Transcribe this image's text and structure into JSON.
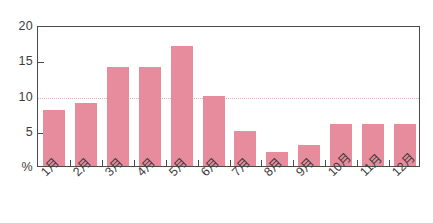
{
  "chart_data": {
    "type": "bar",
    "title": "",
    "subtitle": "",
    "xlabel": "",
    "ylabel": "%",
    "categories": [
      "1月",
      "2月",
      "3月",
      "4月",
      "5月",
      "6月",
      "7月",
      "8月",
      "9月",
      "10月",
      "11月",
      "12月"
    ],
    "values": [
      8,
      9,
      14,
      14,
      17,
      10,
      5,
      2,
      3,
      6,
      6,
      6
    ],
    "ylim": [
      0,
      20
    ],
    "yticks": [
      0,
      5,
      10,
      15,
      20
    ],
    "ytick_labels": [
      "%",
      "5",
      "10",
      "15",
      "20"
    ],
    "grid": true,
    "gridlines_at": [
      10
    ],
    "legend": "none",
    "bar_color": "#e78c9d",
    "grid_color": "#e8a8b4",
    "axis_color": "#4a4a4a",
    "text_color": "#3c3c3c"
  },
  "axis": {
    "y_labels": [
      {
        "value": 20,
        "text": "20"
      },
      {
        "value": 15,
        "text": "15"
      },
      {
        "value": 10,
        "text": "10"
      },
      {
        "value": 5,
        "text": "5"
      },
      {
        "value": 0,
        "text": "%"
      }
    ]
  }
}
